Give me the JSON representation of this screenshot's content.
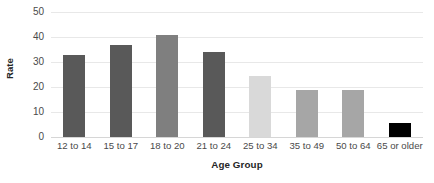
{
  "chart_data": {
    "type": "bar",
    "title": "",
    "xlabel": "Age Group",
    "ylabel": "Rate",
    "categories": [
      "12 to 14",
      "15 to 17",
      "18 to 20",
      "21 to 24",
      "25 to 34",
      "35 to 49",
      "50 to 64",
      "65 or older"
    ],
    "values": [
      33,
      37,
      41,
      34,
      24.5,
      19,
      18.7,
      5.7
    ],
    "ylim": [
      0,
      50
    ],
    "yticks": [
      0,
      10,
      20,
      30,
      40,
      50
    ],
    "ytick_labels": [
      "0",
      "10",
      "20",
      "30",
      "40",
      "50"
    ],
    "grid": true,
    "legend": false,
    "bar_colors": [
      "#595959",
      "#595959",
      "#7f7f7f",
      "#595959",
      "#d9d9d9",
      "#a6a6a6",
      "#a6a6a6",
      "#000000"
    ],
    "colors": {
      "gridline": "#e8e8e8",
      "baseline": "#d6d6d6",
      "tick_text": "#4a4a4a",
      "axis_title_text": "#262626",
      "background": "#ffffff"
    }
  }
}
